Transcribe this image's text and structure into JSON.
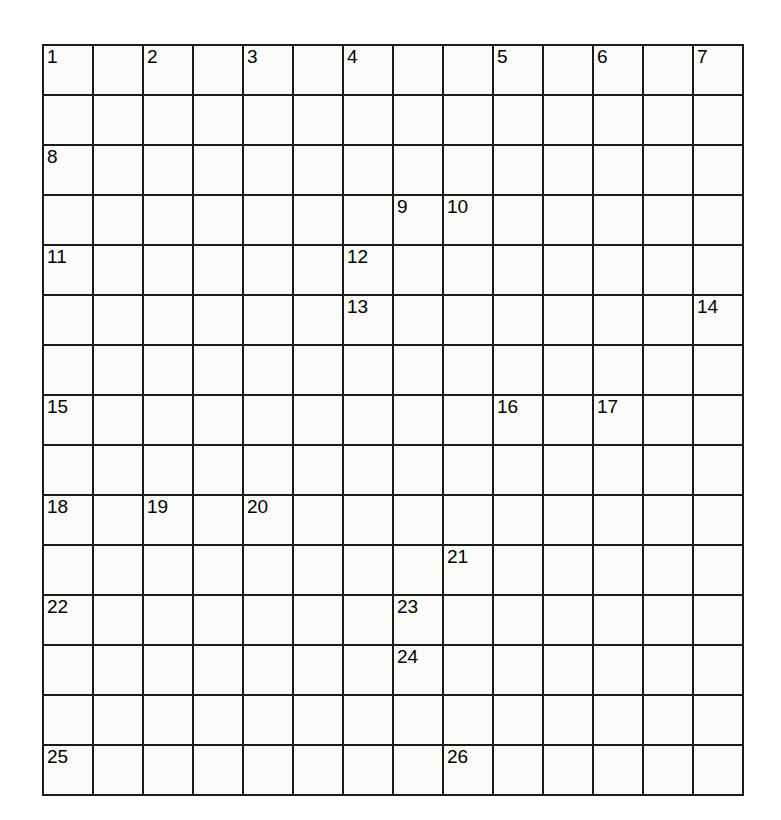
{
  "puzzle": {
    "kind": "crossword-grid",
    "columns": 14,
    "rows": 15,
    "cell_size_px": 48,
    "origin_x_px": 42,
    "origin_y_px": 44,
    "colors": {
      "block": "#141414",
      "open": "#fbfbf9",
      "grid_line": "#1a1a1a",
      "number_text": "#000000",
      "page_background": "#ffffff",
      "bleed_through_text": "#d9d9d9"
    },
    "layout_legend": {
      "1": "block (filled black square)",
      "0": "open (white answer square)"
    },
    "grid": [
      [
        0,
        0,
        0,
        0,
        0,
        1,
        0,
        0,
        0,
        0,
        0,
        0,
        0,
        0
      ],
      [
        0,
        1,
        0,
        1,
        0,
        1,
        0,
        1,
        1,
        0,
        1,
        0,
        1,
        0
      ],
      [
        0,
        0,
        0,
        0,
        0,
        0,
        0,
        1,
        1,
        0,
        1,
        0,
        1,
        0
      ],
      [
        0,
        1,
        0,
        1,
        0,
        1,
        1,
        0,
        0,
        0,
        0,
        0,
        0,
        0
      ],
      [
        0,
        0,
        0,
        0,
        0,
        0,
        0,
        1,
        0,
        1,
        0,
        1,
        0,
        1
      ],
      [
        0,
        1,
        0,
        1,
        0,
        1,
        0,
        0,
        0,
        0,
        0,
        0,
        0,
        0
      ],
      [
        0,
        1,
        0,
        1,
        0,
        1,
        0,
        1,
        0,
        1,
        1,
        1,
        1,
        0
      ],
      [
        0,
        0,
        0,
        0,
        0,
        0,
        0,
        0,
        0,
        0,
        0,
        0,
        0,
        0
      ],
      [
        0,
        1,
        1,
        1,
        1,
        1,
        0,
        1,
        0,
        1,
        0,
        1,
        0,
        1
      ],
      [
        0,
        0,
        0,
        0,
        0,
        0,
        0,
        0,
        0,
        0,
        0,
        0,
        0,
        0
      ],
      [
        1,
        1,
        0,
        1,
        0,
        1,
        0,
        1,
        0,
        0,
        0,
        0,
        0,
        0
      ],
      [
        0,
        0,
        0,
        0,
        0,
        0,
        0,
        0,
        1,
        1,
        0,
        1,
        0,
        1
      ],
      [
        0,
        1,
        0,
        1,
        0,
        1,
        1,
        0,
        0,
        0,
        0,
        0,
        0,
        0
      ],
      [
        0,
        1,
        0,
        1,
        0,
        1,
        1,
        0,
        1,
        1,
        0,
        1,
        0,
        0
      ],
      [
        0,
        0,
        0,
        0,
        0,
        0,
        0,
        1,
        0,
        0,
        0,
        0,
        0,
        0
      ]
    ],
    "numbers": [
      {
        "n": "1",
        "row": 1,
        "col": 1
      },
      {
        "n": "2",
        "row": 1,
        "col": 3
      },
      {
        "n": "3",
        "row": 1,
        "col": 5
      },
      {
        "n": "4",
        "row": 1,
        "col": 7
      },
      {
        "n": "5",
        "row": 1,
        "col": 10
      },
      {
        "n": "6",
        "row": 1,
        "col": 12
      },
      {
        "n": "7",
        "row": 1,
        "col": 14
      },
      {
        "n": "8",
        "row": 3,
        "col": 1
      },
      {
        "n": "9",
        "row": 4,
        "col": 8
      },
      {
        "n": "10",
        "row": 4,
        "col": 9
      },
      {
        "n": "11",
        "row": 5,
        "col": 1
      },
      {
        "n": "12",
        "row": 5,
        "col": 7
      },
      {
        "n": "13",
        "row": 6,
        "col": 7
      },
      {
        "n": "14",
        "row": 6,
        "col": 14
      },
      {
        "n": "15",
        "row": 8,
        "col": 1
      },
      {
        "n": "16",
        "row": 8,
        "col": 10
      },
      {
        "n": "17",
        "row": 8,
        "col": 12
      },
      {
        "n": "18",
        "row": 10,
        "col": 1
      },
      {
        "n": "19",
        "row": 10,
        "col": 3
      },
      {
        "n": "20",
        "row": 10,
        "col": 5
      },
      {
        "n": "21",
        "row": 11,
        "col": 9
      },
      {
        "n": "22",
        "row": 12,
        "col": 1
      },
      {
        "n": "23",
        "row": 12,
        "col": 8
      },
      {
        "n": "24",
        "row": 13,
        "col": 8
      },
      {
        "n": "25",
        "row": 15,
        "col": 1
      },
      {
        "n": "26",
        "row": 15,
        "col": 9
      }
    ],
    "bleed_through": [
      {
        "text": "presentation",
        "x": 285,
        "y": 48,
        "size": 15
      },
      {
        "text": "the",
        "x": 382,
        "y": 118,
        "size": 15
      },
      {
        "text": "Studying",
        "x": 196,
        "y": 178,
        "size": 17
      },
      {
        "text": "type",
        "x": 398,
        "y": 176,
        "size": 17
      },
      {
        "text": "of",
        "x": 470,
        "y": 176,
        "size": 17
      },
      {
        "text": "your",
        "x": 510,
        "y": 176,
        "size": 17
      },
      {
        "text": "possible",
        "x": 196,
        "y": 206,
        "size": 17
      },
      {
        "text": "specific",
        "x": 350,
        "y": 206,
        "size": 17
      },
      {
        "text": "a",
        "x": 488,
        "y": 206,
        "size": 17
      },
      {
        "text": "is",
        "x": 540,
        "y": 206,
        "size": 17
      },
      {
        "text": "assignment",
        "x": 228,
        "y": 262,
        "size": 17
      },
      {
        "text": "resign",
        "x": 430,
        "y": 262,
        "size": 17
      },
      {
        "text": "text",
        "x": 560,
        "y": 320,
        "size": 15
      }
    ]
  }
}
